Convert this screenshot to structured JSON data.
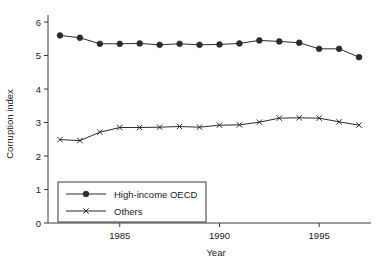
{
  "chart_data": {
    "type": "line",
    "title": "",
    "xlabel": "Year",
    "ylabel": "Corruption index",
    "x": [
      1982,
      1983,
      1984,
      1985,
      1986,
      1987,
      1988,
      1989,
      1990,
      1991,
      1992,
      1993,
      1994,
      1995,
      1996,
      1997
    ],
    "xlim": [
      1981.4,
      1997.6
    ],
    "ylim": [
      0,
      6.25
    ],
    "xticks": [
      1985,
      1990,
      1995
    ],
    "xtick_labels": [
      "1985",
      "1990",
      "1995"
    ],
    "yticks": [
      0,
      1,
      2,
      3,
      4,
      5,
      6
    ],
    "ytick_labels": [
      "0",
      "1",
      "2",
      "3",
      "4",
      "5",
      "6"
    ],
    "grid": false,
    "legend_position": "lower-left-inside",
    "series": [
      {
        "name": "High-income OECD",
        "marker": "filled-circle",
        "values": [
          5.6,
          5.53,
          5.35,
          5.35,
          5.36,
          5.32,
          5.35,
          5.32,
          5.33,
          5.36,
          5.45,
          5.42,
          5.38,
          5.2,
          5.2,
          4.95
        ]
      },
      {
        "name": "Others",
        "marker": "cross-x",
        "values": [
          2.49,
          2.46,
          2.71,
          2.85,
          2.85,
          2.86,
          2.88,
          2.86,
          2.92,
          2.93,
          3.01,
          3.13,
          3.14,
          3.13,
          3.02,
          2.92
        ]
      }
    ]
  },
  "legend": {
    "entries": [
      {
        "label": "High-income OECD"
      },
      {
        "label": "Others"
      }
    ]
  },
  "colors": {
    "line": "#2b2b2b",
    "axis": "#3a3a3a",
    "text": "#1a1a1a",
    "background": "#ffffff"
  }
}
